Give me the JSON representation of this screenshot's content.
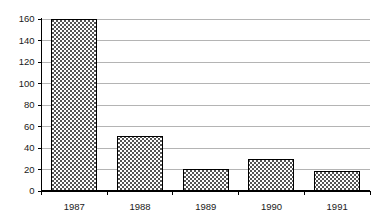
{
  "chart_data": {
    "type": "bar",
    "title": "",
    "subtitle": "",
    "xlabel": "",
    "ylabel": "",
    "categories": [
      "1987",
      "1988",
      "1989",
      "1990",
      "1991"
    ],
    "values": [
      160,
      51,
      20,
      29,
      18
    ],
    "series": [
      {
        "name": "",
        "values": [
          160,
          51,
          20,
          29,
          18
        ]
      }
    ],
    "ylim": [
      0,
      160
    ],
    "xlim_categorical": true,
    "ytick_labels": [
      "0",
      "20",
      "40",
      "60",
      "80",
      "100",
      "120",
      "140",
      "160"
    ],
    "ytick_values": [
      0,
      20,
      40,
      60,
      80,
      100,
      120,
      140,
      160
    ],
    "ytick_step": 20,
    "xtick_labels": [
      "1987",
      "1988",
      "1989",
      "1990",
      "1991"
    ],
    "grid": {
      "horizontal": true,
      "vertical": false,
      "color": "#b4b4b4"
    },
    "legend": {
      "visible": false,
      "position": "none",
      "entries": []
    },
    "annotations": [],
    "bar_style": {
      "fill_pattern": "checkerboard-dotted",
      "fill_background": "#ffffff",
      "pattern_color": "#4d4d4d",
      "border_color": "#000000"
    },
    "axis_style": {
      "axis_color": "#000000",
      "tick_color": "#000000",
      "label_color": "#1a1a1a"
    }
  }
}
